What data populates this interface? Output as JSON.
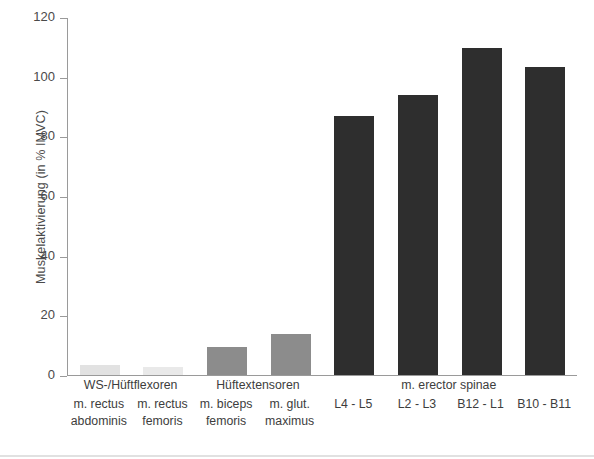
{
  "chart_data": {
    "type": "bar",
    "title": "",
    "xlabel": "",
    "ylabel": "Muskelaktivierung (in % IMVC)",
    "ylim": [
      0,
      120
    ],
    "yticks": [
      0,
      20,
      40,
      60,
      80,
      100,
      120
    ],
    "grid": false,
    "legend": null,
    "categories": [
      "m. rectus abdominis",
      "m. rectus femoris",
      "m. biceps femoris",
      "m. glut. maximus",
      "L4 - L5",
      "L2 - L3",
      "B12 - L1",
      "B10 - B11"
    ],
    "values": [
      3.5,
      2.8,
      9.3,
      13.8,
      87,
      94,
      110,
      103.5
    ],
    "bar_colors": [
      "#e2e2e2",
      "#e9e9e9",
      "#8c8c8c",
      "#8c8c8c",
      "#2e2e2e",
      "#2e2e2e",
      "#2e2e2e",
      "#2e2e2e"
    ],
    "groups": [
      {
        "label": "WS-/Hüftflexoren",
        "members": [
          0,
          1
        ]
      },
      {
        "label": "Hüftextensoren",
        "members": [
          2,
          3
        ]
      },
      {
        "label": "m. erector spinae",
        "members": [
          4,
          5,
          6,
          7
        ]
      }
    ]
  },
  "axis": {
    "y_title": "Muskelaktivierung (in % IMVC)",
    "ticks": [
      {
        "value": 120,
        "label": "120"
      },
      {
        "value": 100,
        "label": "100"
      },
      {
        "value": 80,
        "label": "80"
      },
      {
        "value": 60,
        "label": "60"
      },
      {
        "value": 40,
        "label": "40"
      },
      {
        "value": 20,
        "label": "20"
      },
      {
        "value": 0,
        "label": "0"
      }
    ]
  },
  "x_labels": [
    {
      "line1": "m. rectus",
      "line2": "abdominis"
    },
    {
      "line1": "m. rectus",
      "line2": "femoris"
    },
    {
      "line1": "m. biceps",
      "line2": "femoris"
    },
    {
      "line1": "m. glut.",
      "line2": "maximus"
    },
    {
      "line1": "L4 - L5",
      "line2": ""
    },
    {
      "line1": "L2 - L3",
      "line2": ""
    },
    {
      "line1": "B12 - L1",
      "line2": ""
    },
    {
      "line1": "B10 - B11",
      "line2": ""
    }
  ],
  "group_labels": [
    "WS-/Hüftflexoren",
    "Hüftextensoren",
    "m. erector spinae"
  ],
  "colors": {
    "axis": "#9a9a9a",
    "text": "#3d3d3d",
    "bar_light": "#e2e2e2",
    "bar_mid": "#8c8c8c",
    "bar_dark": "#2e2e2e"
  }
}
